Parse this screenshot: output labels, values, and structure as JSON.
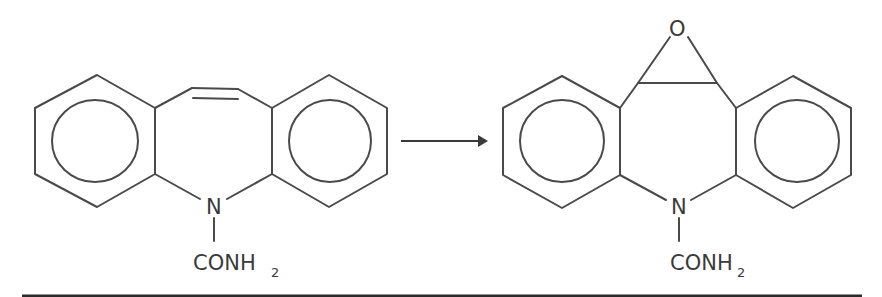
{
  "diagram": {
    "type": "chemical-reaction",
    "reactant": {
      "name": "carbamazepine",
      "substituent_label": "CONH",
      "substituent_subscript": "2",
      "heteroatom_label": "N"
    },
    "arrow": {
      "direction": "right"
    },
    "product": {
      "name": "carbamazepine-10,11-epoxide",
      "substituent_label": "CONH",
      "substituent_subscript": "2",
      "heteroatom_label": "N",
      "epoxide_atom_label": "O"
    },
    "colors": {
      "line": "#4a4a4a",
      "text": "#3a3a3a",
      "rule": "#2a2a2a",
      "background": "#ffffff"
    }
  }
}
